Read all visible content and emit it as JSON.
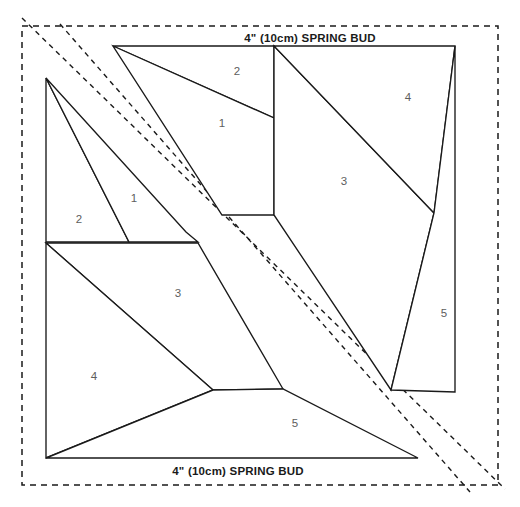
{
  "document": {
    "type": "foundation-paper-piecing-pattern",
    "background_color": "#ffffff",
    "line_color": "#1a1a1a",
    "number_color": "#5d5d5d",
    "width": 520,
    "height": 507
  },
  "labels": {
    "top_edge": "4\" (10cm) SPRING BUD",
    "bottom_edge": "4\" (10cm) SPRING BUD"
  },
  "cutting_frame": {
    "name": "outer-dashed-cut-rectangle",
    "x": 22,
    "y": 26,
    "width": 476,
    "height": 459
  },
  "diagonal_seam_guides": [
    {
      "name": "seam-guide-upper",
      "x1": 22,
      "y1": 18,
      "x2": 505,
      "y2": 489
    },
    {
      "name": "seam-guide-lower",
      "x1": 60,
      "y1": 24,
      "x2": 470,
      "y2": 492
    }
  ],
  "units": [
    {
      "id": "upper-right-unit",
      "patches": [
        {
          "number": "2",
          "label_x": 237,
          "label_y": 72,
          "points": "113,46 274,46 274,118"
        },
        {
          "number": "1",
          "label_x": 222,
          "label_y": 124,
          "points": "113,46 274,118 274,215 222,215"
        },
        {
          "number": "3",
          "label_x": 344,
          "label_y": 182,
          "points": "274,46 274,215 391,390 434,213"
        },
        {
          "number": "4",
          "label_x": 408,
          "label_y": 98,
          "points": "274,46 455,46 434,213"
        },
        {
          "number": "5",
          "label_x": 444,
          "label_y": 314,
          "points": "455,46 455,392 391,390 434,213"
        }
      ]
    },
    {
      "id": "lower-left-unit",
      "patches": [
        {
          "number": "2",
          "label_x": 79,
          "label_y": 220,
          "points": "46,78 46,242 129,242"
        },
        {
          "number": "1",
          "label_x": 134,
          "label_y": 199,
          "points": "46,78 129,242 198,242 186,232"
        },
        {
          "number": "3",
          "label_x": 178,
          "label_y": 294,
          "points": "46,243 198,243 283,389 213,390"
        },
        {
          "number": "4",
          "label_x": 94,
          "label_y": 377,
          "points": "46,243 213,390 46,458"
        },
        {
          "number": "5",
          "label_x": 295,
          "label_y": 424,
          "points": "46,458 213,390 283,389 418,458"
        }
      ]
    }
  ],
  "top_label_position": {
    "x": 310,
    "y": 42
  },
  "bottom_label_position": {
    "x": 238,
    "y": 475
  }
}
